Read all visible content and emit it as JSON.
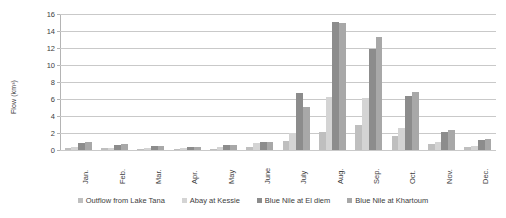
{
  "chart_data": {
    "type": "bar",
    "title": "",
    "xlabel": "",
    "ylabel": "Flow (km³)",
    "ylim": [
      0,
      16
    ],
    "ytick_step": 2,
    "yticks": [
      0,
      2,
      4,
      6,
      8,
      10,
      12,
      14,
      16
    ],
    "grid": true,
    "legend_position": "bottom",
    "categories": [
      "Jan.",
      "Feb.",
      "Mar.",
      "Apr.",
      "May",
      "June",
      "July",
      "Aug.",
      "Sep.",
      "Oct.",
      "Nov.",
      "Dec."
    ],
    "series": [
      {
        "name": "Outflow from Lake Tana",
        "color": "#bfbfbf",
        "values": [
          0.25,
          0.2,
          0.15,
          0.1,
          0.15,
          0.3,
          1.1,
          2.1,
          2.9,
          1.6,
          0.7,
          0.4
        ]
      },
      {
        "name": "Abay at Kessie",
        "color": "#d4d4d4",
        "values": [
          0.3,
          0.25,
          0.2,
          0.2,
          0.35,
          0.8,
          2.0,
          6.2,
          6.1,
          2.6,
          0.9,
          0.5
        ]
      },
      {
        "name": "Blue Nile at El diem",
        "color": "#8c8c8c",
        "values": [
          0.85,
          0.6,
          0.5,
          0.4,
          0.6,
          1.0,
          6.7,
          15.1,
          11.9,
          6.4,
          2.1,
          1.2
        ]
      },
      {
        "name": "Blue Nile at Khartoum",
        "color": "#a8a8a8",
        "values": [
          0.9,
          0.65,
          0.5,
          0.4,
          0.55,
          0.95,
          5.1,
          14.9,
          13.3,
          6.8,
          2.4,
          1.3
        ]
      }
    ]
  }
}
